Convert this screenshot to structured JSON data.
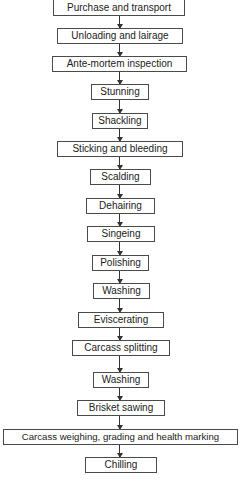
{
  "diagram": {
    "type": "flowchart",
    "direction": "top-to-bottom",
    "nodes": [
      {
        "id": "n1",
        "label": "Purchase and transport"
      },
      {
        "id": "n2",
        "label": "Unloading and lairage"
      },
      {
        "id": "n3",
        "label": "Ante-mortem inspection"
      },
      {
        "id": "n4",
        "label": "Stunning"
      },
      {
        "id": "n5",
        "label": "Shackling"
      },
      {
        "id": "n6",
        "label": "Sticking and bleeding"
      },
      {
        "id": "n7",
        "label": "Scalding"
      },
      {
        "id": "n8",
        "label": "Dehairing"
      },
      {
        "id": "n9",
        "label": "Singeing"
      },
      {
        "id": "n10",
        "label": "Polishing"
      },
      {
        "id": "n11",
        "label": "Washing"
      },
      {
        "id": "n12",
        "label": "Eviscerating"
      },
      {
        "id": "n13",
        "label": "Carcass splitting"
      },
      {
        "id": "n14",
        "label": "Washing"
      },
      {
        "id": "n15",
        "label": "Brisket sawing"
      },
      {
        "id": "n16",
        "label": "Carcass weighing, grading and health marking"
      },
      {
        "id": "n17",
        "label": "Chilling"
      }
    ],
    "edges": [
      [
        "n1",
        "n2"
      ],
      [
        "n2",
        "n3"
      ],
      [
        "n3",
        "n4"
      ],
      [
        "n4",
        "n5"
      ],
      [
        "n5",
        "n6"
      ],
      [
        "n6",
        "n7"
      ],
      [
        "n7",
        "n8"
      ],
      [
        "n8",
        "n9"
      ],
      [
        "n9",
        "n10"
      ],
      [
        "n10",
        "n11"
      ],
      [
        "n11",
        "n12"
      ],
      [
        "n12",
        "n13"
      ],
      [
        "n13",
        "n14"
      ],
      [
        "n14",
        "n15"
      ],
      [
        "n15",
        "n16"
      ],
      [
        "n16",
        "n17"
      ]
    ],
    "colors": {
      "border": "#4a4a4a",
      "text": "#222222",
      "arrow": "#333333",
      "background": "#ffffff"
    }
  }
}
